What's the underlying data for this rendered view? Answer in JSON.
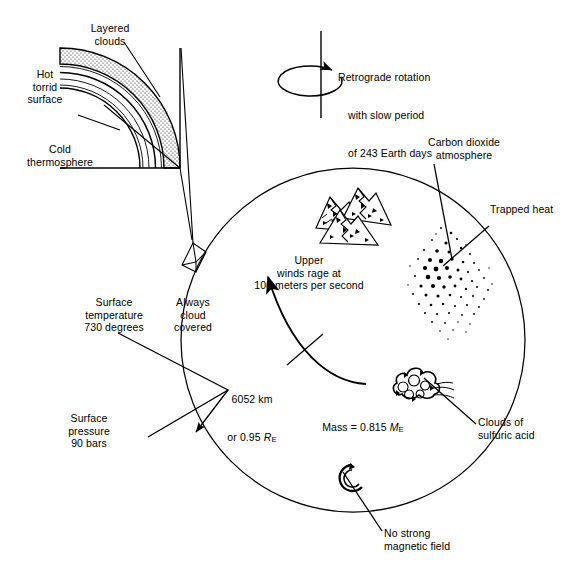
{
  "diagram": {
    "type": "annotated-schematic",
    "stroke_color": "#000000",
    "background_color": "#ffffff"
  },
  "inset": {
    "name": "atmospheric-cross-section-wedge",
    "labels": {
      "layered_clouds": "Layered\nclouds",
      "hot_torrid_surface": "Hot\ntorrid\nsurface",
      "cold_thermosphere": "Cold\nthermosphere"
    }
  },
  "rotation": {
    "line1": "Retrograde rotation",
    "line2": "with slow period",
    "line3": "of 243 Earth days",
    "period_days": 243,
    "direction": "retrograde"
  },
  "annotations": {
    "carbon_dioxide_atmosphere": "Carbon dioxide\natmosphere",
    "trapped_heat": "Trapped heat",
    "clouds_of_sulfuric_acid": "Clouds of\nsulfuric acid",
    "no_strong_magnetic_field": "No strong\nmagnetic field",
    "always_cloud_covered": "Always\ncloud\ncovered",
    "surface_temperature": "Surface\ntemperature\n730 degrees",
    "surface_pressure": "Surface\npressure\n90 bars"
  },
  "interior_labels": {
    "upper_winds": "Upper\nwinds rage at\n100 meters per second",
    "radius_line1": "6052 km",
    "radius_line2_prefix": "or 0.95 ",
    "radius_symbol": "R",
    "radius_subscript": "E",
    "mass_prefix": "Mass = 0.815 ",
    "mass_symbol": "M",
    "mass_subscript": "E"
  },
  "values": {
    "radius_km": 6052,
    "radius_earth_radii": 0.95,
    "mass_earth_masses": 0.815,
    "surface_temperature_degrees": 730,
    "surface_pressure_bars": 90,
    "wind_speed_m_per_s": 100,
    "rotation_period_earth_days": 243
  },
  "glyphs": {
    "mountains": "mountains-icon",
    "stipple_cloud": "trapped-heat-stipple-icon",
    "puffy_cloud": "sulfuric-acid-cloud-icon",
    "magnet": "magnetic-field-glyph-icon",
    "rotation_arrow": "rotation-arrow-icon"
  }
}
